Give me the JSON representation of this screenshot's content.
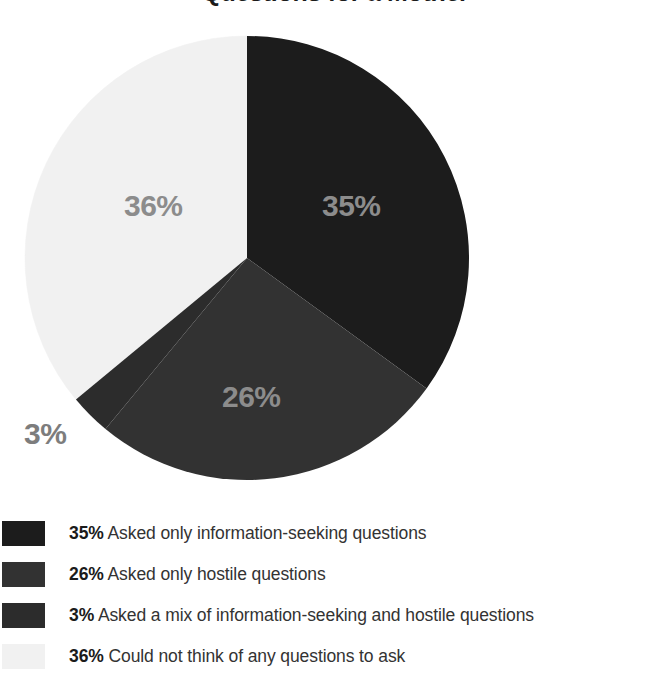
{
  "chart_data": {
    "type": "pie",
    "title": "Questions for a Mother",
    "categories": [
      "Asked only information-seeking questions",
      "Asked only hostile questions",
      "Asked a mix of information-seeking and hostile questions",
      "Could not think of any questions to ask"
    ],
    "values": [
      35,
      26,
      3,
      36
    ],
    "value_labels": [
      "35%",
      "26%",
      "3%",
      "36%"
    ],
    "colors": [
      "#1c1c1c",
      "#323232",
      "#2c2c2c",
      "#f1f1f1"
    ],
    "start_angle_deg": 0,
    "direction": "clockwise",
    "legend_position": "bottom",
    "grid": false,
    "xlabel": "",
    "ylabel": ""
  },
  "title": {
    "text": "Questions for a Mother"
  },
  "pie": {
    "labels": {
      "s1": "35%",
      "s2": "26%",
      "s3": "3%",
      "s4": "36%"
    }
  },
  "legend": {
    "rows": [
      {
        "pct": "35%",
        "desc": "Asked only information-seeking questions",
        "color": "#1c1c1c"
      },
      {
        "pct": "26%",
        "desc": "Asked only hostile questions",
        "color": "#323232"
      },
      {
        "pct": "3%",
        "desc": "Asked a mix of information-seeking and hostile questions",
        "color": "#2c2c2c"
      },
      {
        "pct": "36%",
        "desc": "Could not think of any questions to ask",
        "color": "#f1f1f1"
      }
    ]
  }
}
